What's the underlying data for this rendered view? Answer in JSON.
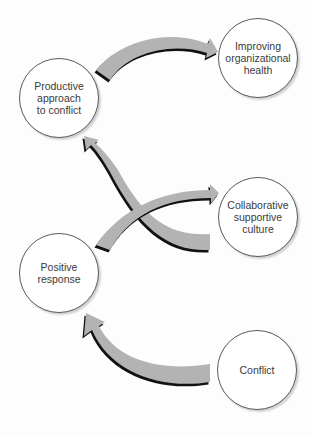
{
  "diagram": {
    "type": "cycle-flow",
    "colors": {
      "arrow_fill": "#b3b3b3",
      "arrow_shadow": "#111111",
      "node_border": "#5a5a5a",
      "node_fill": "#ffffff",
      "text": "#3a3a3a"
    },
    "nodes": [
      {
        "id": "improving",
        "label": "Improving\norganizational\nhealth"
      },
      {
        "id": "productive",
        "label": "Productive\napproach\nto conflict"
      },
      {
        "id": "collaborative",
        "label": "Collaborative\nsupportive\nculture"
      },
      {
        "id": "positive",
        "label": "Positive\nresponse"
      },
      {
        "id": "conflict",
        "label": "Conflict"
      }
    ],
    "edges": [
      {
        "from": "conflict",
        "to": "positive"
      },
      {
        "from": "positive",
        "to": "collaborative"
      },
      {
        "from": "collaborative",
        "to": "productive"
      },
      {
        "from": "productive",
        "to": "improving"
      }
    ]
  }
}
